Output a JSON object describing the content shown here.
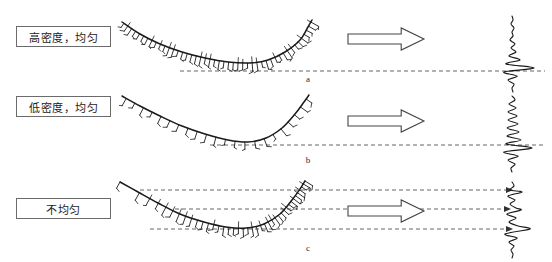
{
  "figure": {
    "width": 552,
    "height": 262,
    "background": "#ffffff",
    "ink_color": "#1a1a1a",
    "dash_color": "#555555",
    "box_border_color": "#6b6b6b"
  },
  "labels": [
    {
      "text": "高密度，均匀",
      "meaning": "high-density-uniform",
      "x": 16,
      "y": 26,
      "w": 95,
      "h": 21
    },
    {
      "text": "低密度，均匀",
      "meaning": "low-density-uniform",
      "x": 16,
      "y": 96,
      "w": 95,
      "h": 21
    },
    {
      "text": "不均匀",
      "meaning": "non-uniform",
      "x": 16,
      "y": 198,
      "w": 95,
      "h": 21
    }
  ],
  "panels": [
    {
      "letter": "a",
      "x": 298,
      "y": 74
    },
    {
      "letter": "b",
      "x": 298,
      "y": 155
    },
    {
      "letter": "c",
      "x": 298,
      "y": 243
    }
  ],
  "arrows": [
    {
      "name": "arrow-row-a",
      "x": 348,
      "y": 28,
      "w": 76,
      "h": 22
    },
    {
      "name": "arrow-row-b",
      "x": 348,
      "y": 110,
      "w": 76,
      "h": 22
    },
    {
      "name": "arrow-row-c",
      "x": 348,
      "y": 200,
      "w": 76,
      "h": 22
    }
  ],
  "dashed_lines": [
    {
      "name": "dashed-line-a-1",
      "y": 71,
      "x1": 180,
      "x2": 545,
      "arrowhead": false
    },
    {
      "name": "dashed-line-b-1",
      "y": 145,
      "x1": 210,
      "x2": 545,
      "arrowhead": false
    },
    {
      "name": "dashed-line-c-1",
      "y": 190,
      "x1": 140,
      "x2": 512,
      "arrowhead": true
    },
    {
      "name": "dashed-line-c-2",
      "y": 209,
      "x1": 175,
      "x2": 510,
      "arrowhead": true
    },
    {
      "name": "dashed-line-c-3",
      "y": 229,
      "x1": 150,
      "x2": 512,
      "arrowhead": true
    }
  ],
  "chart_data": {
    "type": "line",
    "title": "",
    "xlabel": "",
    "ylabel": "",
    "rows": [
      {
        "id": "a",
        "label": "高密度，均匀",
        "curve": {
          "name": "interface-curve-a",
          "points": [
            [
              122,
              22
            ],
            [
              140,
              34
            ],
            [
              160,
              44
            ],
            [
              182,
              52
            ],
            [
              205,
              58
            ],
            [
              228,
              62
            ],
            [
              250,
              63
            ],
            [
              268,
              60
            ],
            [
              285,
              52
            ],
            [
              300,
              40
            ],
            [
              308,
              27
            ],
            [
              312,
              20
            ]
          ],
          "hatch_density": "high",
          "hatch_count": 46,
          "hatch_uniform": true
        },
        "trace": {
          "name": "wiggle-trace-a",
          "baseline_x": 512,
          "y_top": 16,
          "y_bottom": 92,
          "peak_y": 71,
          "peak_amplitude": 22,
          "samples": [
            [
              0,
              0
            ],
            [
              4,
              1
            ],
            [
              8,
              -1
            ],
            [
              12,
              2
            ],
            [
              16,
              0
            ],
            [
              20,
              1
            ],
            [
              24,
              -2
            ],
            [
              28,
              3
            ],
            [
              32,
              -1
            ],
            [
              36,
              4
            ],
            [
              40,
              -3
            ],
            [
              44,
              8
            ],
            [
              48,
              -6
            ],
            [
              52,
              22
            ],
            [
              56,
              -8
            ],
            [
              60,
              5
            ],
            [
              64,
              -4
            ],
            [
              68,
              2
            ],
            [
              72,
              0
            ],
            [
              76,
              1
            ]
          ]
        }
      },
      {
        "id": "b",
        "label": "低密度，均匀",
        "curve": {
          "name": "interface-curve-b",
          "points": [
            [
              122,
              96
            ],
            [
              140,
              106
            ],
            [
              160,
              116
            ],
            [
              182,
              126
            ],
            [
              205,
              134
            ],
            [
              228,
              140
            ],
            [
              248,
              142
            ],
            [
              266,
              138
            ],
            [
              282,
              128
            ],
            [
              295,
              114
            ],
            [
              304,
              102
            ],
            [
              309,
              95
            ]
          ],
          "hatch_density": "low",
          "hatch_count": 22,
          "hatch_uniform": true
        },
        "trace": {
          "name": "wiggle-trace-b",
          "baseline_x": 512,
          "y_top": 96,
          "y_bottom": 176,
          "peak_y": 145,
          "peak_amplitude": 20,
          "samples": [
            [
              0,
              0
            ],
            [
              4,
              3
            ],
            [
              8,
              -3
            ],
            [
              12,
              4
            ],
            [
              16,
              -4
            ],
            [
              20,
              5
            ],
            [
              24,
              -4
            ],
            [
              28,
              6
            ],
            [
              32,
              -5
            ],
            [
              36,
              7
            ],
            [
              40,
              -5
            ],
            [
              44,
              9
            ],
            [
              48,
              -6
            ],
            [
              52,
              20
            ],
            [
              56,
              -8
            ],
            [
              60,
              6
            ],
            [
              64,
              -4
            ],
            [
              68,
              3
            ],
            [
              72,
              -1
            ],
            [
              76,
              0
            ]
          ]
        }
      },
      {
        "id": "c",
        "label": "不均匀",
        "curve": {
          "name": "interface-curve-c",
          "points": [
            [
              120,
              182
            ],
            [
              138,
              192
            ],
            [
              158,
              203
            ],
            [
              180,
              214
            ],
            [
              204,
              222
            ],
            [
              226,
              227
            ],
            [
              246,
              228
            ],
            [
              264,
              224
            ],
            [
              280,
              214
            ],
            [
              292,
              200
            ],
            [
              300,
              189
            ],
            [
              305,
              181
            ]
          ],
          "hatch_density": "mixed",
          "hatch_count": 40,
          "hatch_uniform": false,
          "note": "sparse near upper-left flank, dense along the lower trough and right flank"
        },
        "trace": {
          "name": "wiggle-trace-c",
          "baseline_x": 512,
          "y_top": 182,
          "y_bottom": 258,
          "peaks": [
            190,
            209,
            229
          ],
          "peak_amplitudes": [
            10,
            9,
            18
          ],
          "samples": [
            [
              0,
              0
            ],
            [
              4,
              2
            ],
            [
              8,
              -2
            ],
            [
              10,
              10
            ],
            [
              14,
              -4
            ],
            [
              18,
              3
            ],
            [
              22,
              -2
            ],
            [
              26,
              4
            ],
            [
              28,
              9
            ],
            [
              32,
              -5
            ],
            [
              36,
              4
            ],
            [
              40,
              -3
            ],
            [
              44,
              6
            ],
            [
              47,
              18
            ],
            [
              52,
              -7
            ],
            [
              56,
              5
            ],
            [
              60,
              -3
            ],
            [
              64,
              2
            ],
            [
              68,
              -1
            ],
            [
              72,
              1
            ],
            [
              76,
              0
            ]
          ]
        }
      }
    ]
  }
}
